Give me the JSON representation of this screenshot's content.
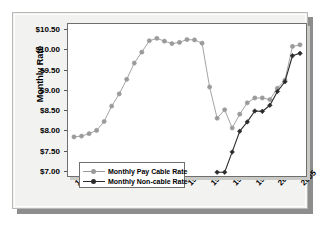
{
  "chart_data": {
    "type": "line",
    "title": "",
    "xlabel": "",
    "ylabel": "Monthly Rate",
    "xlim": [
      1975,
      2005
    ],
    "ylim": [
      7.0,
      10.5
    ],
    "grid": false,
    "legend_position": "bottom-left",
    "y_tick_labels": [
      "$10.50",
      "$10.00",
      "$9.50",
      "$9.00",
      "$8.50",
      "$8.00",
      "$7.50",
      "$7.00"
    ],
    "y_tick_values": [
      10.5,
      10.0,
      9.5,
      9.0,
      8.5,
      8.0,
      7.5,
      7.0
    ],
    "x_tick_labels": [
      "1975",
      "1978",
      "1981",
      "1984",
      "1987",
      "1990",
      "1993",
      "1996",
      "1999",
      "2002",
      "2005"
    ],
    "x_tick_values": [
      1975,
      1978,
      1981,
      1984,
      1987,
      1990,
      1993,
      1996,
      1999,
      2002,
      2005
    ],
    "series": [
      {
        "name": "Monthly Pay Cable Rate",
        "color": "#9a9a9a",
        "marker": "circle",
        "x": [
          1975,
          1976,
          1977,
          1978,
          1979,
          1980,
          1981,
          1982,
          1983,
          1984,
          1985,
          1986,
          1987,
          1988,
          1989,
          1990,
          1991,
          1992,
          1993,
          1994,
          1995,
          1996,
          1997,
          1998,
          1999,
          2000,
          2001,
          2002,
          2003,
          2004,
          2005
        ],
        "values": [
          7.84,
          7.86,
          7.92,
          8.0,
          8.22,
          8.6,
          8.9,
          9.26,
          9.66,
          9.93,
          10.21,
          10.27,
          10.2,
          10.14,
          10.17,
          10.24,
          10.23,
          10.15,
          9.07,
          8.3,
          8.51,
          8.06,
          8.4,
          8.68,
          8.8,
          8.8,
          8.76,
          9.04,
          9.24,
          10.07,
          10.11
        ]
      },
      {
        "name": "Monthly Non-cable Rate",
        "color": "#2b2b2b",
        "marker": "diamond",
        "x": [
          1994,
          1995,
          1996,
          1997,
          1998,
          1999,
          2000,
          2001,
          2002,
          2003,
          2004,
          2005
        ],
        "values": [
          6.97,
          6.97,
          7.47,
          7.98,
          8.21,
          8.48,
          8.47,
          8.62,
          8.96,
          9.2,
          9.84,
          9.9
        ]
      }
    ]
  },
  "legend": {
    "items": [
      {
        "label": "Monthly Pay Cable Rate"
      },
      {
        "label": "Monthly Non-cable Rate"
      }
    ]
  }
}
